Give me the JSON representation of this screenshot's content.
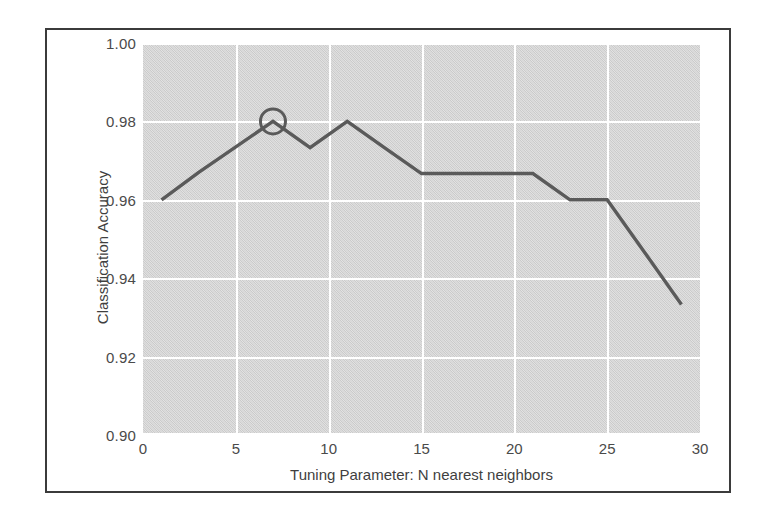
{
  "chart_data": {
    "type": "line",
    "title": "",
    "xlabel": "Tuning Parameter: N nearest neighbors",
    "ylabel": "Classification Accuracy",
    "xlim": [
      0,
      30
    ],
    "ylim": [
      0.9,
      1.0
    ],
    "grid": true,
    "legend": "none",
    "plot_bgcolor": "#d7d7d7",
    "gridline_color": "#ffffff",
    "line_color": "#5a5a5a",
    "marker_color": "#5a5a5a",
    "xticks": [
      "0",
      "5",
      "10",
      "15",
      "20",
      "25",
      "30"
    ],
    "xtick_values": [
      0,
      5,
      10,
      15,
      20,
      25,
      30
    ],
    "yticks": [
      "0.90",
      "0.92",
      "0.94",
      "0.96",
      "0.98",
      "1.00"
    ],
    "ytick_values": [
      0.9,
      0.92,
      0.94,
      0.96,
      0.98,
      1.0
    ],
    "series": [
      {
        "name": "Classification Accuracy",
        "x": [
          1,
          3,
          5,
          7,
          9,
          11,
          13,
          15,
          17,
          19,
          21,
          23,
          25,
          27,
          29
        ],
        "values": [
          0.96,
          0.967,
          0.9735,
          0.98,
          0.9733,
          0.98,
          0.9733,
          0.9667,
          0.9667,
          0.9667,
          0.9667,
          0.96,
          0.96,
          0.9467,
          0.9333
        ]
      }
    ],
    "annotations": [
      {
        "type": "circle-marker",
        "label": "best-tuning-parameter",
        "x": 7,
        "y": 0.98
      }
    ]
  }
}
